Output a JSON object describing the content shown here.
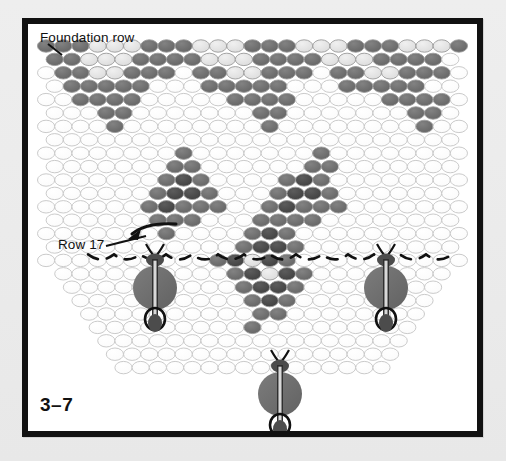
{
  "figure": {
    "number": "3–7",
    "type": "beadwork-pattern-diagram"
  },
  "labels": {
    "foundation_row": "Foundation row",
    "row17": "Row 17"
  },
  "colors": {
    "page_background": "#ebebeb",
    "frame_border": "#111111",
    "paper": "#ffffff",
    "bead_outline": "#b9b9b9",
    "bead_white": "#ffffff",
    "bead_light": "#e2e2e2",
    "bead_mid": "#8c8c8c",
    "bead_dark": "#6e6e6e",
    "bead_darker": "#4a4a4a",
    "thread": "#111111",
    "dangle_bead": "#6e6e6e",
    "dangle_small": "#4a4a4a"
  },
  "bead_grid": {
    "bead_width": 17.2,
    "bead_height": 12.4,
    "row_step": 13.4,
    "origin_x": 9,
    "origin_y": 22,
    "legend": {
      "0": "white / empty",
      "1": "light gray",
      "2": "medium gray",
      "3": "dark gray",
      "4": "darkest gray"
    },
    "rows": [
      {
        "n": 1,
        "offset": 0.0,
        "cells": [
          3,
          3,
          3,
          1,
          1,
          1,
          3,
          3,
          3,
          1,
          1,
          1,
          3,
          3,
          3,
          1,
          1,
          1,
          3,
          3,
          3,
          1,
          1,
          1,
          3
        ]
      },
      {
        "n": 2,
        "offset": 0.5,
        "cells": [
          3,
          3,
          1,
          1,
          1,
          3,
          3,
          3,
          3,
          1,
          1,
          1,
          3,
          3,
          3,
          3,
          1,
          1,
          1,
          3,
          3,
          3,
          3,
          0
        ]
      },
      {
        "n": 3,
        "offset": 0.0,
        "cells": [
          0,
          3,
          3,
          1,
          1,
          3,
          3,
          3,
          0,
          3,
          3,
          1,
          1,
          3,
          3,
          3,
          0,
          3,
          3,
          1,
          1,
          3,
          3,
          3,
          0
        ]
      },
      {
        "n": 4,
        "offset": 0.5,
        "cells": [
          0,
          3,
          3,
          3,
          3,
          3,
          0,
          0,
          0,
          3,
          3,
          3,
          3,
          3,
          0,
          0,
          0,
          3,
          3,
          3,
          3,
          3,
          0,
          0
        ]
      },
      {
        "n": 5,
        "offset": 0.0,
        "cells": [
          0,
          0,
          3,
          3,
          3,
          3,
          0,
          0,
          0,
          0,
          0,
          3,
          3,
          3,
          3,
          0,
          0,
          0,
          0,
          0,
          3,
          3,
          3,
          3,
          0
        ]
      },
      {
        "n": 6,
        "offset": 0.5,
        "cells": [
          0,
          0,
          0,
          3,
          3,
          0,
          0,
          0,
          0,
          0,
          0,
          0,
          3,
          3,
          0,
          0,
          0,
          0,
          0,
          0,
          0,
          3,
          3,
          0
        ]
      },
      {
        "n": 7,
        "offset": 0.0,
        "cells": [
          0,
          0,
          0,
          0,
          3,
          0,
          0,
          0,
          0,
          0,
          0,
          0,
          0,
          3,
          0,
          0,
          0,
          0,
          0,
          0,
          0,
          0,
          3,
          0,
          0
        ]
      },
      {
        "n": 8,
        "offset": 0.5,
        "cells": [
          0,
          0,
          0,
          0,
          0,
          0,
          0,
          0,
          0,
          0,
          0,
          0,
          0,
          0,
          0,
          0,
          0,
          0,
          0,
          0,
          0,
          0,
          0,
          0
        ]
      },
      {
        "n": 9,
        "offset": 0.0,
        "cells": [
          0,
          0,
          0,
          0,
          0,
          0,
          0,
          0,
          3,
          0,
          0,
          0,
          0,
          0,
          0,
          0,
          3,
          0,
          0,
          0,
          0,
          0,
          0,
          0,
          0
        ]
      },
      {
        "n": 10,
        "offset": 0.5,
        "cells": [
          0,
          0,
          0,
          0,
          0,
          0,
          0,
          3,
          3,
          0,
          0,
          0,
          0,
          0,
          0,
          3,
          3,
          0,
          0,
          0,
          0,
          0,
          0,
          0
        ]
      },
      {
        "n": 11,
        "offset": 0.0,
        "cells": [
          0,
          0,
          0,
          0,
          0,
          0,
          0,
          3,
          4,
          3,
          0,
          0,
          0,
          0,
          3,
          4,
          3,
          0,
          0,
          0,
          0,
          0,
          0,
          0,
          0
        ]
      },
      {
        "n": 12,
        "offset": 0.5,
        "cells": [
          0,
          0,
          0,
          0,
          0,
          0,
          3,
          4,
          4,
          3,
          0,
          0,
          0,
          3,
          4,
          4,
          3,
          0,
          0,
          0,
          0,
          0,
          0,
          0
        ]
      },
      {
        "n": 13,
        "offset": 0.0,
        "cells": [
          0,
          0,
          0,
          0,
          0,
          0,
          3,
          4,
          3,
          3,
          3,
          0,
          0,
          3,
          4,
          3,
          3,
          3,
          0,
          0,
          0,
          0,
          0,
          0,
          0
        ]
      },
      {
        "n": 14,
        "offset": 0.5,
        "cells": [
          0,
          0,
          0,
          0,
          0,
          0,
          3,
          3,
          3,
          0,
          0,
          0,
          3,
          3,
          3,
          3,
          0,
          0,
          0,
          0,
          0,
          0,
          0,
          0
        ]
      },
      {
        "n": 15,
        "offset": 0.0,
        "cells": [
          0,
          0,
          0,
          0,
          0,
          0,
          0,
          3,
          0,
          0,
          0,
          0,
          3,
          4,
          3,
          0,
          0,
          0,
          0,
          0,
          0,
          0,
          0,
          0,
          0
        ]
      },
      {
        "n": 16,
        "offset": 0.5,
        "cells": [
          0,
          0,
          0,
          0,
          0,
          0,
          0,
          0,
          0,
          0,
          0,
          3,
          4,
          4,
          3,
          0,
          0,
          0,
          0,
          0,
          0,
          0,
          0,
          0
        ]
      },
      {
        "n": 17,
        "offset": 0.0,
        "cells": [
          0,
          0,
          0,
          0,
          0,
          0,
          0,
          0,
          0,
          0,
          3,
          4,
          1,
          4,
          3,
          0,
          0,
          0,
          0,
          0,
          0,
          0,
          0,
          0,
          0
        ]
      },
      {
        "n": 18,
        "offset": 0.5,
        "cells": [
          0,
          0,
          0,
          0,
          0,
          0,
          0,
          0,
          0,
          0,
          3,
          4,
          1,
          4,
          3,
          0,
          0,
          0,
          0,
          0,
          0,
          0,
          0
        ]
      },
      {
        "n": 19,
        "offset": 0.0,
        "cells": [
          0,
          0,
          0,
          0,
          0,
          0,
          0,
          0,
          0,
          0,
          3,
          4,
          4,
          3,
          0,
          0,
          0,
          0,
          0,
          0,
          0,
          0
        ]
      },
      {
        "n": 20,
        "offset": 0.5,
        "cells": [
          0,
          0,
          0,
          0,
          0,
          0,
          0,
          0,
          0,
          0,
          3,
          4,
          3,
          0,
          0,
          0,
          0,
          0,
          0,
          0,
          0
        ]
      },
      {
        "n": 21,
        "offset": 0.0,
        "cells": [
          0,
          0,
          0,
          0,
          0,
          0,
          0,
          0,
          0,
          0,
          3,
          3,
          0,
          0,
          0,
          0,
          0,
          0,
          0,
          0
        ]
      },
      {
        "n": 22,
        "offset": 0.5,
        "cells": [
          0,
          0,
          0,
          0,
          0,
          0,
          0,
          0,
          0,
          3,
          0,
          0,
          0,
          0,
          0,
          0,
          0,
          0,
          0
        ]
      },
      {
        "n": 23,
        "offset": 0.0,
        "cells": [
          0,
          0,
          0,
          0,
          0,
          0,
          0,
          0,
          0,
          0,
          0,
          0,
          0,
          0,
          0,
          0,
          0,
          0
        ]
      },
      {
        "n": 24,
        "offset": 0.5,
        "cells": [
          0,
          0,
          0,
          0,
          0,
          0,
          0,
          0,
          0,
          0,
          0,
          0,
          0,
          0,
          0,
          0,
          0
        ]
      },
      {
        "n": 25,
        "offset": 0.0,
        "cells": [
          0,
          0,
          0,
          0,
          0,
          0,
          0,
          0,
          0,
          0,
          0,
          0,
          0,
          0,
          0,
          0
        ]
      }
    ]
  },
  "dangles": [
    {
      "name": "dangle-left",
      "x": 127,
      "top_y": 232
    },
    {
      "name": "dangle-center",
      "x": 252,
      "top_y": 338
    },
    {
      "name": "dangle-right",
      "x": 358,
      "top_y": 232
    }
  ],
  "annotations": [
    {
      "name": "foundation-row-leader",
      "from": [
        38,
        40
      ],
      "to": [
        52,
        52
      ]
    },
    {
      "name": "row17-arrow",
      "from": [
        88,
        228
      ],
      "to": [
        122,
        236
      ]
    }
  ]
}
